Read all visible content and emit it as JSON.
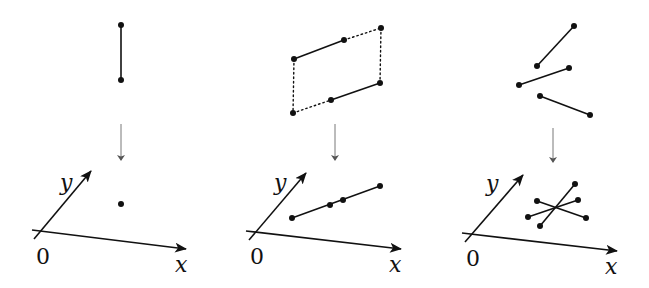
{
  "diagram": {
    "colors": {
      "ink": "#111111",
      "arrow": "#555555",
      "background": "#ffffff"
    },
    "axis_labels": {
      "x": "x",
      "y": "y",
      "origin": "0"
    },
    "panels": [
      {
        "name": "vertical-segment",
        "top_segments": [
          {
            "style": "solid",
            "from": [
              121,
              25
            ],
            "to": [
              121,
              80
            ]
          }
        ],
        "top_dotted": [],
        "projection_arrow": {
          "x": 121,
          "from_y": 124,
          "to_y": 160
        },
        "axes": {
          "x_from": [
            32,
            230
          ],
          "x_to": [
            186,
            249
          ],
          "y_from": [
            34,
            239
          ],
          "y_to": [
            91,
            171
          ],
          "y_label": [
            68,
            190
          ],
          "zero_label": [
            36,
            264
          ],
          "x_label": [
            175,
            272
          ]
        },
        "bottom_segments": [],
        "bottom_points": [
          [
            121,
            204
          ]
        ]
      },
      {
        "name": "parallel-segments",
        "top_segments": [
          {
            "style": "solid",
            "from": [
              294,
              59
            ],
            "to": [
              344,
              40
            ]
          },
          {
            "style": "solid",
            "from": [
              331,
              100
            ],
            "to": [
              380,
              83
            ]
          }
        ],
        "top_dotted": [
          {
            "from": [
              344,
              40
            ],
            "to": [
              381,
              28
            ]
          },
          {
            "from": [
              381,
              28
            ],
            "to": [
              380,
              83
            ]
          },
          {
            "from": [
              294,
              59
            ],
            "to": [
              293,
              113
            ]
          },
          {
            "from": [
              293,
              113
            ],
            "to": [
              331,
              100
            ]
          }
        ],
        "top_points": [
          [
            294,
            59
          ],
          [
            344,
            40
          ],
          [
            381,
            28
          ],
          [
            380,
            83
          ],
          [
            331,
            100
          ],
          [
            293,
            113
          ]
        ],
        "projection_arrow": {
          "x": 335,
          "from_y": 124,
          "to_y": 160
        },
        "axes": {
          "x_from": [
            246,
            231
          ],
          "x_to": [
            401,
            249
          ],
          "y_from": [
            249,
            240
          ],
          "y_to": [
            306,
            173
          ],
          "y_label": [
            282,
            190
          ],
          "zero_label": [
            250,
            264
          ],
          "x_label": [
            389,
            272
          ]
        },
        "bottom_segments": [
          {
            "from": [
              292,
              218
            ],
            "to": [
              380,
              186
            ]
          }
        ],
        "bottom_points": [
          [
            292,
            218
          ],
          [
            330,
            205
          ],
          [
            343,
            200
          ],
          [
            380,
            186
          ]
        ]
      },
      {
        "name": "general-segments",
        "top_segments": [
          {
            "style": "solid",
            "from": [
              537,
              66
            ],
            "to": [
              574,
              26
            ]
          },
          {
            "style": "solid",
            "from": [
              519,
              85
            ],
            "to": [
              569,
              68
            ]
          },
          {
            "style": "solid",
            "from": [
              540,
              96
            ],
            "to": [
              590,
              115
            ]
          }
        ],
        "top_dotted": [],
        "top_points": [
          [
            537,
            66
          ],
          [
            574,
            26
          ],
          [
            519,
            85
          ],
          [
            569,
            68
          ],
          [
            540,
            96
          ],
          [
            590,
            115
          ]
        ],
        "projection_arrow": {
          "x": 553,
          "from_y": 128,
          "to_y": 162
        },
        "axes": {
          "x_from": [
            462,
            233
          ],
          "x_to": [
            617,
            251
          ],
          "y_from": [
            465,
            242
          ],
          "y_to": [
            523,
            175
          ],
          "y_label": [
            494,
            191
          ],
          "zero_label": [
            466,
            266
          ],
          "x_label": [
            605,
            274
          ]
        },
        "bottom_segments": [
          {
            "from": [
              540,
              226
            ],
            "to": [
              575,
              184
            ]
          },
          {
            "from": [
              528,
              217
            ],
            "to": [
              578,
              200
            ]
          },
          {
            "from": [
              537,
              201
            ],
            "to": [
              586,
              218
            ]
          }
        ],
        "bottom_points": [
          [
            540,
            226
          ],
          [
            575,
            184
          ],
          [
            528,
            217
          ],
          [
            578,
            200
          ],
          [
            537,
            201
          ],
          [
            586,
            218
          ]
        ]
      }
    ]
  }
}
